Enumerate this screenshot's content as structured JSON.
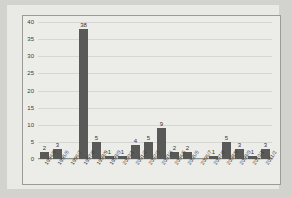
{
  "chart_data": {
    "type": "bar",
    "title": "",
    "xlabel": "",
    "ylabel": "",
    "ylim": [
      0,
      40
    ],
    "yticks": [
      0,
      5,
      10,
      15,
      20,
      25,
      30,
      35,
      40
    ],
    "grid": true,
    "legend": false,
    "bar_color": "#595957",
    "categories": [
      "1994/5",
      "1995/6",
      "1996/7",
      "1997/8",
      "1998/9",
      "1999/0",
      "2000/1",
      "2001/2",
      "2002/3",
      "2003/4",
      "2004/5",
      "2005/6",
      "2006/7",
      "2007/8",
      "2008/9",
      "2009/0",
      "2010/1",
      "2011/2"
    ],
    "values": [
      2,
      3,
      0,
      38,
      5,
      1,
      1,
      4,
      5,
      9,
      2,
      2,
      0,
      1,
      5,
      3,
      1,
      3
    ],
    "value_labels": [
      "2",
      "3",
      "",
      "38",
      "5",
      "1",
      "1",
      "4",
      "5",
      "9",
      "2",
      "2",
      "",
      "1",
      "5",
      "3",
      "1",
      "3"
    ]
  }
}
